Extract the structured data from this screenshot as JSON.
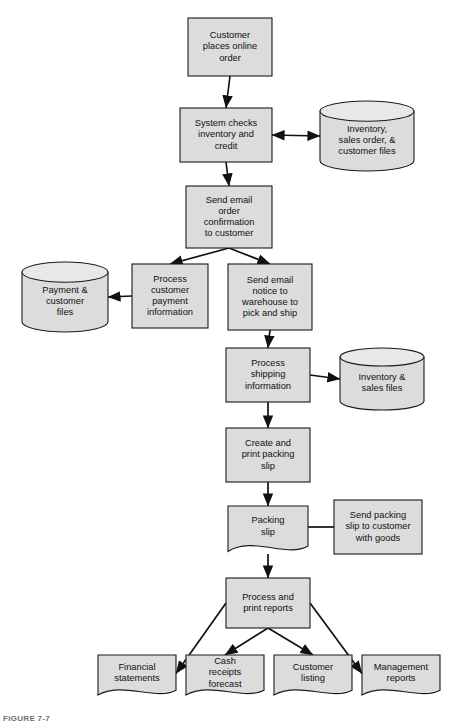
{
  "figure": {
    "caption": "FIGURE 7-7",
    "colors": {
      "node_fill": "#dcdcdc",
      "cylinder_top_fill": "#e8e8e8",
      "stroke": "#1a1a1a",
      "connector": "#111111",
      "background": "#ffffff",
      "caption_text": "#6f6f6f"
    }
  },
  "nodes": [
    {
      "id": "customer-places-online-order",
      "shape": "process",
      "lines": [
        "Customer",
        "places online",
        "order"
      ],
      "x": 188,
      "y": 18,
      "w": 84,
      "h": 58
    },
    {
      "id": "system-checks-inventory-and-credit",
      "shape": "process",
      "lines": [
        "System checks",
        "inventory and",
        "credit"
      ],
      "x": 180,
      "y": 108,
      "w": 92,
      "h": 54
    },
    {
      "id": "inventory-sales-order-customer-files",
      "shape": "cylinder",
      "lines": [
        "Inventory,",
        "sales order, &",
        "customer files"
      ],
      "x": 320,
      "y": 101,
      "w": 94,
      "h": 70
    },
    {
      "id": "send-email-order-confirmation-to-customer",
      "shape": "process",
      "lines": [
        "Send email",
        "order",
        "confirmation",
        "to customer"
      ],
      "x": 186,
      "y": 186,
      "w": 86,
      "h": 62
    },
    {
      "id": "process-customer-payment-information",
      "shape": "process",
      "lines": [
        "Process",
        "customer",
        "payment",
        "information"
      ],
      "x": 132,
      "y": 264,
      "w": 76,
      "h": 64
    },
    {
      "id": "payment-customer-files",
      "shape": "cylinder",
      "lines": [
        "Payment &",
        "customer",
        "files"
      ],
      "x": 22,
      "y": 262,
      "w": 86,
      "h": 70
    },
    {
      "id": "send-email-notice-to-warehouse",
      "shape": "process",
      "lines": [
        "Send email",
        "notice to",
        "warehouse to",
        "pick and ship"
      ],
      "x": 228,
      "y": 264,
      "w": 84,
      "h": 66
    },
    {
      "id": "process-shipping-information",
      "shape": "process",
      "lines": [
        "Process",
        "shipping",
        "information"
      ],
      "x": 226,
      "y": 348,
      "w": 84,
      "h": 54
    },
    {
      "id": "inventory-sales-files",
      "shape": "cylinder",
      "lines": [
        "Inventory &",
        "sales files"
      ],
      "x": 340,
      "y": 348,
      "w": 84,
      "h": 62
    },
    {
      "id": "create-and-print-packing-slip",
      "shape": "process",
      "lines": [
        "Create and",
        "print packing",
        "slip"
      ],
      "x": 226,
      "y": 428,
      "w": 84,
      "h": 54
    },
    {
      "id": "packing-slip",
      "shape": "document",
      "lines": [
        "Packing",
        "slip"
      ],
      "x": 228,
      "y": 506,
      "w": 80,
      "h": 50
    },
    {
      "id": "send-packing-slip-to-customer-with-goods",
      "shape": "process",
      "lines": [
        "Send packing",
        "slip to customer",
        "with goods"
      ],
      "x": 334,
      "y": 500,
      "w": 88,
      "h": 54
    },
    {
      "id": "process-and-print-reports",
      "shape": "process",
      "lines": [
        "Process and",
        "print reports"
      ],
      "x": 226,
      "y": 578,
      "w": 84,
      "h": 50
    },
    {
      "id": "financial-statements",
      "shape": "document",
      "lines": [
        "Financial",
        "statements"
      ],
      "x": 98,
      "y": 655,
      "w": 78,
      "h": 44
    },
    {
      "id": "cash-receipts-forecast",
      "shape": "document",
      "lines": [
        "Cash",
        "receipts",
        "forecast"
      ],
      "x": 186,
      "y": 655,
      "w": 78,
      "h": 44
    },
    {
      "id": "customer-listing",
      "shape": "document",
      "lines": [
        "Customer",
        "listing"
      ],
      "x": 274,
      "y": 655,
      "w": 78,
      "h": 44
    },
    {
      "id": "management-reports",
      "shape": "document",
      "lines": [
        "Management",
        "reports"
      ],
      "x": 362,
      "y": 655,
      "w": 78,
      "h": 44
    }
  ],
  "connectors": [
    {
      "id": "order-to-system",
      "from": "customer-places-online-order",
      "to": "system-checks-inventory-and-credit",
      "arrow": "end"
    },
    {
      "id": "system-to-inventory-files",
      "from": "system-checks-inventory-and-credit",
      "to": "inventory-sales-order-customer-files",
      "arrow": "both"
    },
    {
      "id": "system-to-send-confirmation",
      "from": "system-checks-inventory-and-credit",
      "to": "send-email-order-confirmation-to-customer",
      "arrow": "end"
    },
    {
      "id": "confirmation-to-process-payment",
      "from": "send-email-order-confirmation-to-customer",
      "to": "process-customer-payment-information",
      "arrow": "end"
    },
    {
      "id": "confirmation-to-warehouse-notice",
      "from": "send-email-order-confirmation-to-customer",
      "to": "send-email-notice-to-warehouse",
      "arrow": "end"
    },
    {
      "id": "process-payment-to-payment-files",
      "from": "process-customer-payment-information",
      "to": "payment-customer-files",
      "arrow": "end"
    },
    {
      "id": "warehouse-notice-to-process-shipping",
      "from": "send-email-notice-to-warehouse",
      "to": "process-shipping-information",
      "arrow": "end"
    },
    {
      "id": "process-shipping-to-inventory-sales-files",
      "from": "process-shipping-information",
      "to": "inventory-sales-files",
      "arrow": "end"
    },
    {
      "id": "process-shipping-to-create-packing-slip",
      "from": "process-shipping-information",
      "to": "create-and-print-packing-slip",
      "arrow": "end"
    },
    {
      "id": "create-packing-slip-to-packing-slip",
      "from": "create-and-print-packing-slip",
      "to": "packing-slip",
      "arrow": "end"
    },
    {
      "id": "packing-slip-to-send-packing-slip",
      "from": "packing-slip",
      "to": "send-packing-slip-to-customer-with-goods",
      "arrow": "none"
    },
    {
      "id": "packing-slip-to-process-reports",
      "from": "packing-slip",
      "to": "process-and-print-reports",
      "arrow": "end"
    },
    {
      "id": "reports-to-financial-statements",
      "from": "process-and-print-reports",
      "to": "financial-statements",
      "arrow": "end"
    },
    {
      "id": "reports-to-cash-receipts-forecast",
      "from": "process-and-print-reports",
      "to": "cash-receipts-forecast",
      "arrow": "end"
    },
    {
      "id": "reports-to-customer-listing",
      "from": "process-and-print-reports",
      "to": "customer-listing",
      "arrow": "end"
    },
    {
      "id": "reports-to-management-reports",
      "from": "process-and-print-reports",
      "to": "management-reports",
      "arrow": "end"
    }
  ]
}
